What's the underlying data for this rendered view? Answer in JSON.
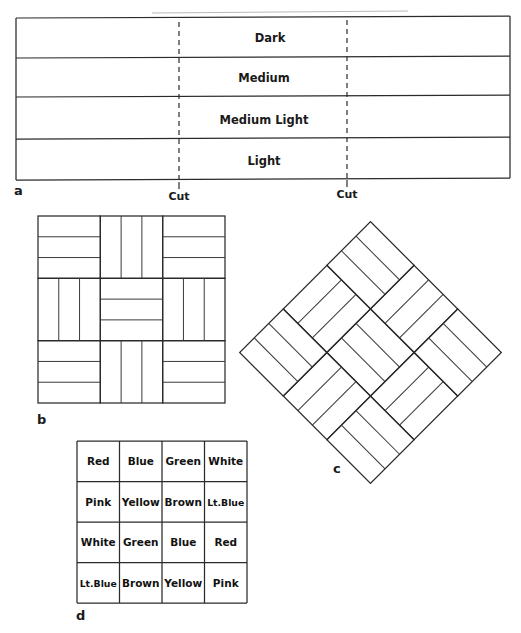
{
  "figure": {
    "type": "parquet-flooring-diagram",
    "panels": [
      {
        "id": "a",
        "label": "a",
        "caption": "board strip layout with cut lines"
      },
      {
        "id": "b",
        "label": "b",
        "caption": "square basketweave parquet block"
      },
      {
        "id": "c",
        "label": "c",
        "caption": "diagonal basketweave parquet block"
      },
      {
        "id": "d",
        "label": "d",
        "caption": "color arrangement grid"
      }
    ]
  },
  "panel_a": {
    "label": "a",
    "strips": [
      {
        "name": "Dark"
      },
      {
        "name": "Medium"
      },
      {
        "name": "Medium Light"
      },
      {
        "name": "Light"
      }
    ],
    "cut_marks": [
      {
        "label": "Cut"
      },
      {
        "label": "Cut"
      }
    ]
  },
  "panel_b": {
    "label": "b",
    "blocks_per_side": 3,
    "strips_per_block": 3,
    "orientation_grid": [
      [
        "horizontal",
        "vertical",
        "horizontal"
      ],
      [
        "vertical",
        "horizontal",
        "vertical"
      ],
      [
        "horizontal",
        "vertical",
        "horizontal"
      ]
    ]
  },
  "panel_c": {
    "label": "c",
    "rotation_degrees": 45,
    "blocks_per_side": 3,
    "strips_per_block": 3,
    "orientation_grid": [
      [
        "horizontal",
        "vertical",
        "horizontal"
      ],
      [
        "vertical",
        "horizontal",
        "vertical"
      ],
      [
        "horizontal",
        "vertical",
        "horizontal"
      ]
    ]
  },
  "panel_d": {
    "label": "d",
    "rows": [
      [
        "Red",
        "Blue",
        "Green",
        "White"
      ],
      [
        "Pink",
        "Yellow",
        "Brown",
        "Lt.Blue"
      ],
      [
        "White",
        "Green",
        "Blue",
        "Red"
      ],
      [
        "Lt.Blue",
        "Brown",
        "Yellow",
        "Pink"
      ]
    ]
  },
  "colors": {
    "line": "#2b2b2b",
    "text": "#1a1a1a",
    "background": "#ffffff"
  }
}
